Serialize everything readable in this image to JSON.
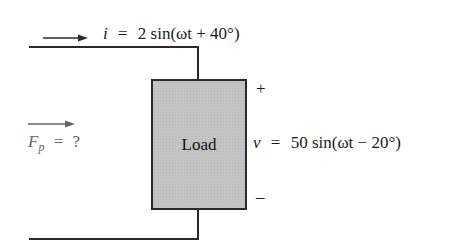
{
  "diagram": {
    "type": "circuit",
    "current": {
      "symbol": "i",
      "equals": "=",
      "expression": "2 sin(ωt + 40°)",
      "amplitude": "2",
      "phase": "40°",
      "full": "i = 2 sin(ωt + 40°)"
    },
    "voltage": {
      "symbol": "v",
      "equals": "=",
      "expression": "50 sin(ωt − 20°)",
      "amplitude": "50",
      "phase": "−20°",
      "full": "v = 50 sin(ωt − 20°)"
    },
    "load": {
      "label": "Load"
    },
    "polarity": {
      "plus": "+",
      "minus": "–"
    },
    "power_factor": {
      "symbol": "F",
      "subscript": "p",
      "equals": "=",
      "value": "?"
    },
    "colors": {
      "wire": "#2a2a2a",
      "load_fill": "#c4c4c4",
      "text": "#1a1a1a",
      "power_factor_text": "#666666"
    }
  }
}
